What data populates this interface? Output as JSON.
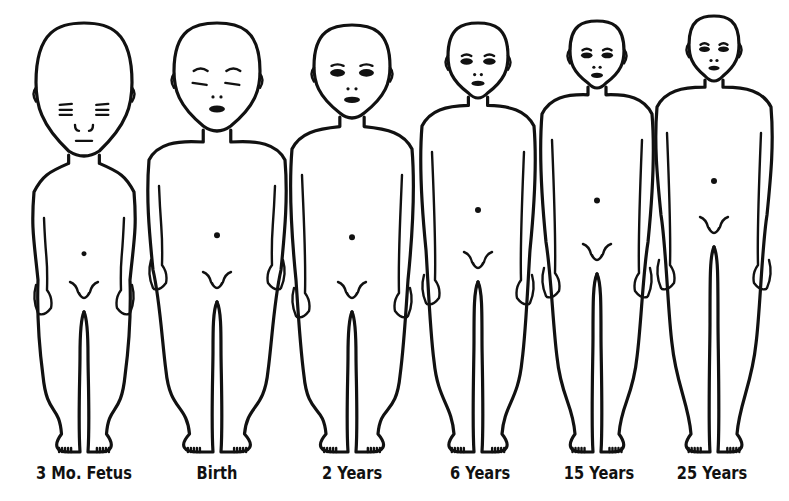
{
  "diagram": {
    "ink_color": "#111111",
    "background_color": "#ffffff",
    "figures": [
      {
        "label": "3 Mo. Fetus",
        "cx": 84,
        "headTop": 23,
        "headW": 48,
        "chin": 155,
        "neck": 14,
        "shoulderY": 178,
        "shoulderW": 50,
        "hipY": 300,
        "hipW": 45,
        "feetY": 452,
        "armEnd": 315,
        "face": "fetus"
      },
      {
        "label": "Birth",
        "cx": 217,
        "headTop": 23,
        "headW": 43,
        "chin": 130,
        "neck": 20,
        "shoulderY": 146,
        "shoulderW": 68,
        "hipY": 290,
        "hipW": 55,
        "feetY": 452,
        "armEnd": 290,
        "face": "baby"
      },
      {
        "label": "2 Years",
        "cx": 352,
        "headTop": 25,
        "headW": 38,
        "chin": 117,
        "neck": 16,
        "shoulderY": 135,
        "shoulderW": 60,
        "hipY": 300,
        "hipW": 52,
        "feetY": 452,
        "armEnd": 318,
        "face": "toddler"
      },
      {
        "label": "6 Years",
        "cx": 478,
        "headTop": 23,
        "headW": 30,
        "chin": 97,
        "neck": 14,
        "shoulderY": 112,
        "shoulderW": 56,
        "hipY": 270,
        "hipW": 48,
        "feetY": 452,
        "armEnd": 305,
        "face": "child"
      },
      {
        "label": "15 Years",
        "cx": 597,
        "headTop": 21,
        "headW": 27,
        "chin": 87,
        "neck": 13,
        "shoulderY": 100,
        "shoulderW": 55,
        "hipY": 262,
        "hipW": 44,
        "feetY": 452,
        "armEnd": 298,
        "face": "teen"
      },
      {
        "label": "25 Years",
        "cx": 714,
        "headTop": 16,
        "headW": 25,
        "chin": 80,
        "neck": 12,
        "shoulderY": 93,
        "shoulderW": 57,
        "hipY": 235,
        "hipW": 46,
        "feetY": 452,
        "armEnd": 290,
        "face": "adult"
      }
    ]
  }
}
